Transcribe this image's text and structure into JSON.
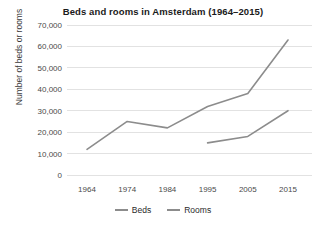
{
  "chart_data": {
    "type": "line",
    "title": "Beds and rooms in Amsterdam (1964–2015)",
    "xlabel": "",
    "ylabel": "Number of beds or rooms",
    "categories": [
      "1964",
      "1974",
      "1984",
      "1995",
      "2005",
      "2015"
    ],
    "x": [
      1964,
      1974,
      1984,
      1995,
      2005,
      2015
    ],
    "series": [
      {
        "name": "Beds",
        "color": "#8c8c8c",
        "values": [
          12000,
          25000,
          22000,
          32000,
          38000,
          63000
        ]
      },
      {
        "name": "Rooms",
        "color": "#8c8c8c",
        "values": [
          null,
          null,
          null,
          15000,
          18000,
          30000
        ]
      }
    ],
    "ylim": [
      0,
      70000
    ],
    "yticks": [
      0,
      10000,
      20000,
      30000,
      40000,
      50000,
      60000,
      70000
    ],
    "ytick_labels": [
      "0",
      "10,000",
      "20,000",
      "30,000",
      "40,000",
      "50,000",
      "60,000",
      "70,000"
    ],
    "grid": true,
    "legend_position": "bottom",
    "legend": [
      "Beds",
      "Rooms"
    ]
  },
  "legend_entries": [
    {
      "label": "Beds"
    },
    {
      "label": "Rooms"
    }
  ]
}
